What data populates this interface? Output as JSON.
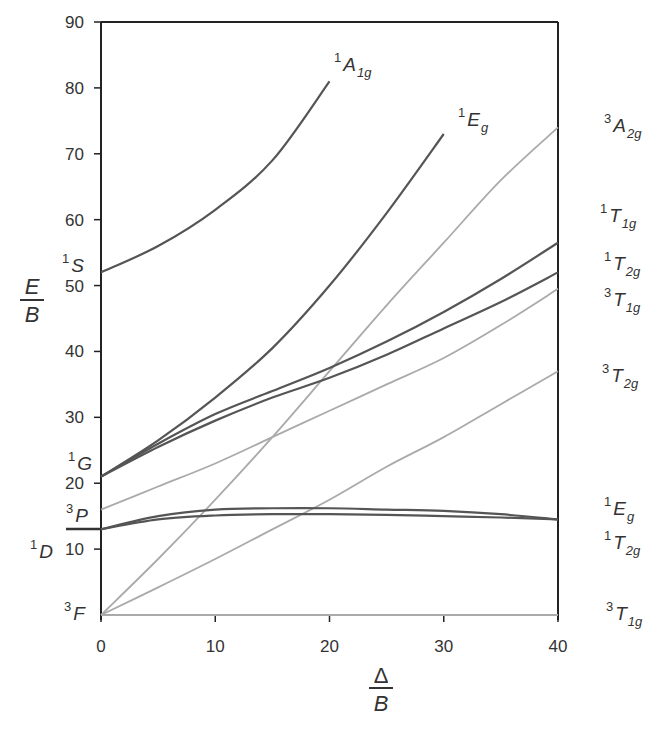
{
  "chart_data": {
    "type": "line",
    "xlabel": "Δ/B",
    "ylabel": "E/B",
    "xlim": [
      0,
      40
    ],
    "ylim": [
      0,
      90
    ],
    "x_ticks": [
      0,
      10,
      20,
      30,
      40
    ],
    "y_ticks": [
      10,
      20,
      30,
      40,
      50,
      60,
      70,
      80,
      90
    ],
    "grid": false,
    "free_ion_terms": [
      {
        "label": "S",
        "mult": "1",
        "E": 52
      },
      {
        "label": "G",
        "mult": "1",
        "E": 21
      },
      {
        "label": "P",
        "mult": "3",
        "E": 16
      },
      {
        "label": "D",
        "mult": "1",
        "E": 13
      },
      {
        "label": "F",
        "mult": "3",
        "E": 0
      }
    ],
    "series": [
      {
        "name": "1A1g",
        "mult": "1",
        "sym": "A",
        "sub": "1g",
        "color": "#555555",
        "x": [
          0,
          5,
          10,
          15,
          20
        ],
        "values": [
          52,
          56,
          61.5,
          69,
          81
        ]
      },
      {
        "name": "1Eg (G)",
        "mult": "1",
        "sym": "E",
        "sub": "g",
        "color": "#555555",
        "x": [
          0,
          5,
          10,
          15,
          20,
          25,
          30
        ],
        "values": [
          21,
          26.5,
          33,
          40.5,
          50,
          61,
          73
        ]
      },
      {
        "name": "3A2g",
        "mult": "3",
        "sym": "A",
        "sub": "2g",
        "color": "#aaaaaa",
        "x": [
          0,
          5,
          10,
          15,
          20,
          25,
          30,
          35,
          40
        ],
        "values": [
          0,
          8.5,
          17.5,
          27,
          37,
          47,
          56.5,
          66,
          74
        ]
      },
      {
        "name": "1T1g",
        "mult": "1",
        "sym": "T",
        "sub": "1g",
        "color": "#555555",
        "x": [
          0,
          5,
          10,
          15,
          20,
          25,
          30,
          35,
          40
        ],
        "values": [
          21,
          26,
          30.5,
          34,
          37.5,
          41.5,
          46,
          51,
          56.5
        ]
      },
      {
        "name": "1T2g (G)",
        "mult": "1",
        "sym": "T",
        "sub": "2g",
        "color": "#555555",
        "x": [
          0,
          5,
          10,
          15,
          20,
          25,
          30,
          35,
          40
        ],
        "values": [
          21,
          25.5,
          29.5,
          33,
          36,
          39.5,
          43.5,
          47.5,
          52
        ]
      },
      {
        "name": "3T1g (P)",
        "mult": "3",
        "sym": "T",
        "sub": "1g",
        "color": "#aaaaaa",
        "x": [
          0,
          5,
          10,
          15,
          20,
          25,
          30,
          35,
          40
        ],
        "values": [
          16,
          19.5,
          23,
          27,
          31,
          35,
          39,
          44,
          49.5
        ]
      },
      {
        "name": "3T2g",
        "mult": "3",
        "sym": "T",
        "sub": "2g",
        "color": "#aaaaaa",
        "x": [
          0,
          5,
          10,
          15,
          20,
          25,
          30,
          35,
          40
        ],
        "values": [
          0,
          4.2,
          8.5,
          13,
          17.5,
          22.5,
          27,
          32,
          37
        ]
      },
      {
        "name": "1Eg (D)",
        "mult": "1",
        "sym": "E",
        "sub": "g",
        "color": "#555555",
        "x": [
          0,
          5,
          10,
          15,
          20,
          25,
          30,
          35,
          40
        ],
        "values": [
          13,
          15,
          16,
          16.2,
          16.2,
          16,
          15.8,
          15.3,
          14.5
        ]
      },
      {
        "name": "1T2g (D)",
        "mult": "1",
        "sym": "T",
        "sub": "2g",
        "color": "#555555",
        "x": [
          0,
          5,
          10,
          15,
          20,
          25,
          30,
          35,
          40
        ],
        "values": [
          13,
          14.5,
          15.1,
          15.3,
          15.3,
          15.2,
          15,
          14.8,
          14.5
        ]
      },
      {
        "name": "3T1g (F)",
        "mult": "3",
        "sym": "T",
        "sub": "1g",
        "color": "#aaaaaa",
        "x": [
          0,
          40
        ],
        "values": [
          0,
          0
        ]
      }
    ]
  },
  "axes": {
    "y_label_num": "E",
    "y_label_den": "B",
    "x_label_num": "Δ",
    "x_label_den": "B",
    "x_tick_labels": [
      "0",
      "10",
      "20",
      "30",
      "40"
    ],
    "y_tick_labels": [
      "90",
      "80",
      "70",
      "60",
      "50",
      "40",
      "30",
      "20",
      "10"
    ]
  },
  "left_terms": [
    {
      "mult": "1",
      "sym": "S"
    },
    {
      "mult": "1",
      "sym": "G"
    },
    {
      "mult": "3",
      "sym": "P"
    },
    {
      "mult": "1",
      "sym": "D"
    },
    {
      "mult": "3",
      "sym": "F"
    }
  ],
  "right_terms": [
    {
      "mult": "3",
      "sym": "A",
      "sub": "2g"
    },
    {
      "mult": "1",
      "sym": "T",
      "sub": "1g"
    },
    {
      "mult": "1",
      "sym": "T",
      "sub": "2g"
    },
    {
      "mult": "3",
      "sym": "T",
      "sub": "1g"
    },
    {
      "mult": "3",
      "sym": "T",
      "sub": "2g"
    },
    {
      "mult": "1",
      "sym": "E",
      "sub": "g"
    },
    {
      "mult": "1",
      "sym": "T",
      "sub": "2g"
    },
    {
      "mult": "3",
      "sym": "T",
      "sub": "1g"
    }
  ],
  "inline_terms": [
    {
      "mult": "1",
      "sym": "A",
      "sub": "1g"
    },
    {
      "mult": "1",
      "sym": "E",
      "sub": "g"
    }
  ],
  "colors": {
    "singlet": "#555555",
    "triplet": "#aaaaaa",
    "axis": "#222222"
  }
}
